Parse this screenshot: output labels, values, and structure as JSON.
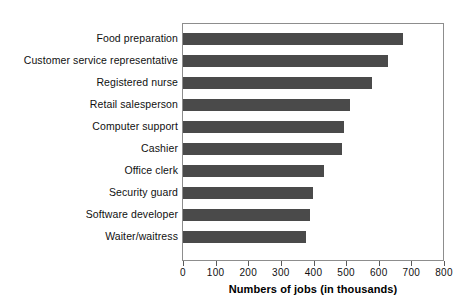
{
  "chart_data": {
    "type": "bar",
    "orientation": "horizontal",
    "title": "",
    "subtitle": "",
    "xlabel": "Numbers of jobs (in thousands)",
    "ylabel": "",
    "xlim": [
      0,
      800
    ],
    "xticks": [
      0,
      100,
      200,
      300,
      400,
      500,
      600,
      700,
      800
    ],
    "xtick_labels": [
      "0",
      "100",
      "200",
      "300",
      "400",
      "500",
      "600",
      "700",
      "800"
    ],
    "grid": false,
    "legend": false,
    "categories": [
      "Food preparation",
      "Customer service representative",
      "Registered nurse",
      "Retail salesperson",
      "Computer support",
      "Cashier",
      "Office clerk",
      "Security guard",
      "Software developer",
      "Waiter/waitress"
    ],
    "values": [
      675,
      628,
      580,
      512,
      495,
      487,
      432,
      398,
      390,
      377
    ],
    "series": [
      {
        "name": "Numbers of jobs (in thousands)",
        "values": [
          675,
          628,
          580,
          512,
          495,
          487,
          432,
          398,
          390,
          377
        ]
      }
    ],
    "bar_color": "#4a4a4a",
    "frame_color": "#8d8d8d",
    "background_color": "#ffffff"
  }
}
